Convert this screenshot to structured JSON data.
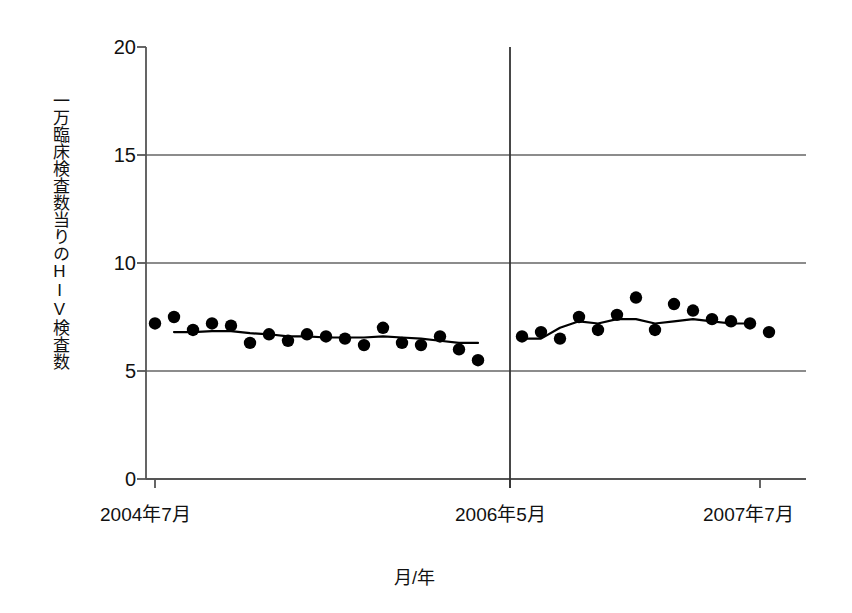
{
  "chart_data": {
    "type": "scatter",
    "title": "",
    "subtitle": "",
    "xlabel": "月/年",
    "ylabel": "一万臨床検査数当りのHIV検査数",
    "ylim": [
      0,
      20
    ],
    "yticks": [
      0,
      5,
      10,
      15,
      20
    ],
    "ytick_labels": [
      "0",
      "5",
      "10",
      "15",
      "20"
    ],
    "grid": "horizontal-at-5-10-15",
    "legend": "none",
    "annotations": [
      {
        "name": "period-divider",
        "label": "2006年5月",
        "note": "vertical rule separating the two observation periods"
      }
    ],
    "xtick_labels": [
      "2004年7月",
      "2006年5月",
      "2007年7月"
    ],
    "xticks_x": [
      155,
      510,
      760
    ],
    "series": [
      {
        "name": "観測値 期間1",
        "kind": "scatter",
        "x": [
          155,
          174,
          193,
          212,
          231,
          250,
          269,
          288,
          307,
          326,
          345,
          364,
          383,
          402,
          421,
          440,
          459,
          478
        ],
        "values": [
          7.2,
          7.5,
          6.9,
          7.2,
          7.1,
          6.3,
          6.7,
          6.4,
          6.7,
          6.6,
          6.5,
          6.2,
          7.0,
          6.3,
          6.2,
          6.6,
          6.0,
          5.5
        ]
      },
      {
        "name": "移動平均 期間1",
        "kind": "line",
        "x": [
          174,
          193,
          212,
          231,
          250,
          269,
          288,
          307,
          326,
          345,
          364,
          383,
          402,
          421,
          440,
          459,
          478
        ],
        "values": [
          6.8,
          6.8,
          6.85,
          6.85,
          6.75,
          6.7,
          6.6,
          6.6,
          6.55,
          6.55,
          6.55,
          6.6,
          6.55,
          6.5,
          6.4,
          6.3,
          6.3
        ]
      },
      {
        "name": "観測値 期間2",
        "kind": "scatter",
        "x": [
          522,
          541,
          560,
          579,
          598,
          617,
          636,
          655,
          674,
          693,
          712,
          731,
          750,
          769
        ],
        "values": [
          6.6,
          6.8,
          6.5,
          7.5,
          6.9,
          7.6,
          8.4,
          6.9,
          8.1,
          7.8,
          7.4,
          7.3,
          7.2,
          6.8
        ]
      },
      {
        "name": "移動平均 期間2",
        "kind": "line",
        "x": [
          522,
          541,
          560,
          579,
          598,
          617,
          636,
          655,
          674,
          693,
          712,
          731,
          750
        ],
        "values": [
          6.5,
          6.5,
          7.0,
          7.3,
          7.2,
          7.4,
          7.4,
          7.2,
          7.3,
          7.4,
          7.3,
          7.2,
          7.2
        ]
      }
    ]
  },
  "axes": {
    "y_label_text": "一万臨床検査数当りのHIV検査数",
    "x_label_text": "月/年",
    "y_ticks": [
      "20",
      "15",
      "10",
      "5",
      "0"
    ],
    "x_ticks": [
      "2004年7月",
      "2006年5月",
      "2007年7月"
    ]
  },
  "colors": {
    "marker": "#000000",
    "line": "#000000",
    "axis": "#555555",
    "grid": "#666666",
    "text": "#111111",
    "background": "#ffffff"
  }
}
